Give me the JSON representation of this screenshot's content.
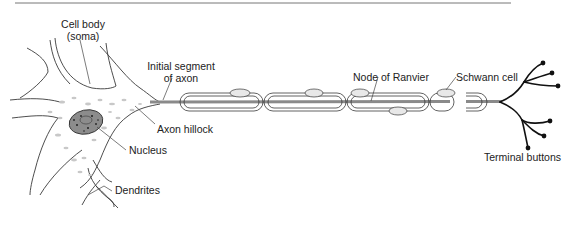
{
  "diagram": {
    "labels": {
      "cell_body_line1": "Cell body",
      "cell_body_line2": "(soma)",
      "initial_segment_line1": "Initial segment",
      "initial_segment_line2": "of axon",
      "axon_hillock": "Axon hillock",
      "nucleus": "Nucleus",
      "dendrites": "Dendrites",
      "node_of_ranvier": "Node of Ranvier",
      "schwann_cell": "Schwann cell",
      "terminal_buttons": "Terminal buttons"
    },
    "colors": {
      "outline": "#3a3a3a",
      "axon": "#8a8a8a",
      "nucleus_fill": "#8c8c8c",
      "terminals": "#111111",
      "rule": "#777777"
    }
  }
}
